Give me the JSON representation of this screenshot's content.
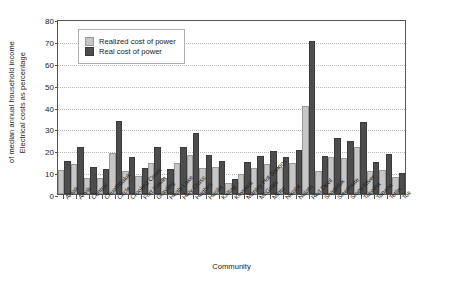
{
  "chart_data": {
    "type": "bar",
    "title": "",
    "xlabel": "Community",
    "ylabel_line1": "Electrical costs as percentage",
    "ylabel_line2": "of median annual household income",
    "ylim": [
      0,
      80
    ],
    "yticks": [
      0,
      10,
      20,
      30,
      40,
      50,
      60,
      70,
      80
    ],
    "grid": true,
    "legend_position": "upper-left-inside",
    "categories": [
      "Aniak",
      "Anvik",
      "Central",
      "Chuathbaluk",
      "Circle",
      "Crooked Creek",
      "Fort Yukon",
      "Grayling",
      "Healy Lake",
      "Holy Cross",
      "Hughes",
      "Huslia",
      "Kaltag",
      "Koyukuk",
      "Manley Hot Springs",
      "McGrath",
      "Minto",
      "Nikolai",
      "Nulato",
      "Red Devil",
      "Shageluk",
      "Sleetmute",
      "Stony River",
      "Takotna",
      "Tanana",
      "Tetlin",
      "Tok"
    ],
    "series": [
      {
        "name": "Realized cost of power",
        "color": "#c6c6c6",
        "values": [
          10,
          13,
          6.5,
          6.5,
          18,
          9.5,
          7.5,
          13.5,
          6.5,
          13.5,
          17,
          11,
          11.5,
          4,
          8.5,
          11,
          13,
          11.5,
          13.5,
          40,
          9.5,
          16,
          15.5,
          21,
          9.5,
          10,
          7
        ]
      },
      {
        "name": "Real cost of power",
        "color": "#4d4d4d",
        "values": [
          14.5,
          21,
          11.5,
          10.5,
          33,
          16,
          11,
          21,
          10.5,
          21,
          27.5,
          17,
          14.5,
          6,
          14,
          16.5,
          19,
          16,
          19.5,
          70,
          16.5,
          25,
          23.5,
          32.5,
          14,
          17.5,
          9
        ]
      }
    ]
  },
  "legend": {
    "items": [
      {
        "label": "Realized cost of power",
        "key": "realized"
      },
      {
        "label": "Real cost of power",
        "key": "real"
      }
    ]
  }
}
